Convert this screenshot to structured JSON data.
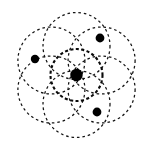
{
  "figure": {
    "canvas": {
      "width": 154,
      "height": 149
    },
    "background_color": "#ffffff",
    "stroke_color": "#141414",
    "nucleus_color": "#000000",
    "electron_color": "#000000"
  },
  "chart_data": {
    "type": "scatter",
    "subtitle": "",
    "xlabel": "",
    "ylabel": "",
    "grid": false,
    "legend": "none",
    "xlim": [
      0,
      154
    ],
    "ylim": [
      0,
      149
    ],
    "center": {
      "x": 76.5,
      "y": 75.0
    },
    "nucleus": {
      "label": "nucleus",
      "x": 76.5,
      "y": 75.0,
      "radius": 6.2,
      "color": "#000000"
    },
    "inner_orbit": {
      "label": "inner electron shell",
      "cx": 76.5,
      "cy": 75.0,
      "radius": 26.0,
      "style": "dashed",
      "stroke_width": 2.1
    },
    "petal_orbits": {
      "label": "outer electron shells",
      "count": 6,
      "radius": 33.5,
      "ring_offset": 29.0,
      "style": "dashed",
      "stroke_width": 1.25,
      "angles_deg": [
        90,
        150,
        210,
        270,
        330,
        30
      ],
      "centers": [
        {
          "cx": 76.5,
          "cy": 46.0
        },
        {
          "cx": 51.4,
          "cy": 60.5
        },
        {
          "cx": 51.4,
          "cy": 89.5
        },
        {
          "cx": 76.5,
          "cy": 104.0
        },
        {
          "cx": 101.6,
          "cy": 89.5
        },
        {
          "cx": 101.6,
          "cy": 60.5
        }
      ]
    },
    "electrons": [
      {
        "label": "electron-left",
        "x": 35.0,
        "y": 59.0,
        "radius": 4.2
      },
      {
        "label": "electron-top-right",
        "x": 100.0,
        "y": 38.0,
        "radius": 4.4
      },
      {
        "label": "electron-bottom-right",
        "x": 97.0,
        "y": 112.0,
        "radius": 4.4
      }
    ]
  }
}
